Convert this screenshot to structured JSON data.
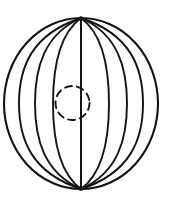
{
  "figure": {
    "background_color": "#ffffff",
    "stroke_color": "#141414",
    "width": 169,
    "height": 207
  },
  "chart_data": {
    "type": "diagram",
    "xlabel": "",
    "ylabel": "",
    "grid": false,
    "legend": "none",
    "xlim": [
      0,
      169
    ],
    "ylim": [
      0,
      207
    ],
    "annotations": [],
    "elements": {
      "outer_sphere": {
        "shape": "ellipse",
        "center": [
          81,
          103.5
        ],
        "radius_x": 77,
        "radius_y": 85.5,
        "stroke": "#141414",
        "stroke_width": 2.1,
        "dashed": false
      },
      "north_pole": {
        "x": 81,
        "y": 18
      },
      "south_pole": {
        "x": 81,
        "y": 189
      },
      "meridian_count": 9,
      "meridians": [
        {
          "index": 0,
          "half_width": 77,
          "bulge_direction": "left",
          "label": "outer-left-limb"
        },
        {
          "index": 1,
          "half_width": 62,
          "bulge_direction": "left",
          "label": "meridian-left-1"
        },
        {
          "index": 2,
          "half_width": 46,
          "bulge_direction": "left",
          "label": "meridian-left-2"
        },
        {
          "index": 3,
          "half_width": 28,
          "bulge_direction": "left",
          "label": "meridian-left-3"
        },
        {
          "index": 4,
          "half_width": 0,
          "bulge_direction": "none",
          "label": "polar-axis"
        },
        {
          "index": 5,
          "half_width": 28,
          "bulge_direction": "right",
          "label": "meridian-right-3"
        },
        {
          "index": 6,
          "half_width": 46,
          "bulge_direction": "right",
          "label": "meridian-right-2"
        },
        {
          "index": 7,
          "half_width": 62,
          "bulge_direction": "right",
          "label": "meridian-right-1"
        },
        {
          "index": 8,
          "half_width": 77,
          "bulge_direction": "right",
          "label": "outer-right-limb"
        }
      ],
      "core_circle": {
        "shape": "circle",
        "center": [
          72.5,
          103
        ],
        "radius": 17,
        "stroke": "#141414",
        "stroke_width": 1.9,
        "dashed": true,
        "dash_pattern": "7 5"
      }
    }
  }
}
